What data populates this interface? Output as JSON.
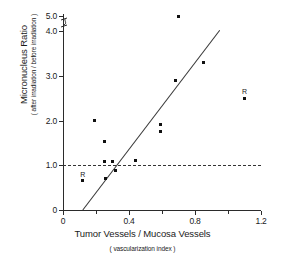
{
  "chart_data": {
    "type": "scatter",
    "title": "",
    "xlabel": "Tumor Vessels / Mucosa Vessels",
    "xlabel_sub": "( vascularization index )",
    "ylabel": "Micronucleus Ratio",
    "ylabel_sub": "( after irradiation / before irradiation )",
    "xlim": [
      0,
      1.2
    ],
    "ylim": [
      0,
      5.0
    ],
    "y_axis_break": {
      "present": true,
      "between": [
        4.0,
        5.0
      ]
    },
    "grid": false,
    "legend": null,
    "x_ticks": [
      {
        "value": 0,
        "label": "0",
        "major": true
      },
      {
        "value": 0.2,
        "label": "",
        "major": false
      },
      {
        "value": 0.4,
        "label": "0.4",
        "major": true
      },
      {
        "value": 0.6,
        "label": "",
        "major": false
      },
      {
        "value": 0.8,
        "label": "0.8",
        "major": true
      },
      {
        "value": 1.0,
        "label": "",
        "major": false
      },
      {
        "value": 1.2,
        "label": "1.2",
        "major": true
      }
    ],
    "y_ticks": [
      {
        "value": 0,
        "label": "0",
        "major": true
      },
      {
        "value": 1.0,
        "label": "1.0",
        "major": true
      },
      {
        "value": 2.0,
        "label": "2.0",
        "major": true
      },
      {
        "value": 3.0,
        "label": "3.0",
        "major": true
      },
      {
        "value": 4.0,
        "label": "4.0",
        "major": true
      },
      {
        "value": 5.0,
        "label": "5.0",
        "major": true
      }
    ],
    "points": [
      {
        "x": 0.12,
        "y": 0.65,
        "label": "R"
      },
      {
        "x": 0.19,
        "y": 2.0,
        "label": ""
      },
      {
        "x": 0.25,
        "y": 1.52,
        "label": ""
      },
      {
        "x": 0.25,
        "y": 1.08,
        "label": ""
      },
      {
        "x": 0.26,
        "y": 0.7,
        "label": ""
      },
      {
        "x": 0.3,
        "y": 1.08,
        "label": ""
      },
      {
        "x": 0.32,
        "y": 0.88,
        "label": ""
      },
      {
        "x": 0.44,
        "y": 1.1,
        "label": ""
      },
      {
        "x": 0.59,
        "y": 1.75,
        "label": ""
      },
      {
        "x": 0.59,
        "y": 1.9,
        "label": ""
      },
      {
        "x": 0.68,
        "y": 2.9,
        "label": ""
      },
      {
        "x": 0.7,
        "y": 5.0,
        "label": ""
      },
      {
        "x": 0.85,
        "y": 3.3,
        "label": ""
      },
      {
        "x": 1.1,
        "y": 2.5,
        "label": "R"
      }
    ],
    "reference_line": {
      "y": 1.0,
      "style": "dashed",
      "x_from": 0.0,
      "x_to": 1.2
    },
    "fit_line": {
      "style": "solid",
      "x_from": 0.12,
      "y_from": 0.0,
      "x_to": 0.95,
      "y_to": 4.05
    },
    "colors": {
      "point": "#111111",
      "axis": "#2b2b2b",
      "fit_line": "#3a3a3a",
      "reference_line": "#333333",
      "background": "#ffffff"
    }
  }
}
